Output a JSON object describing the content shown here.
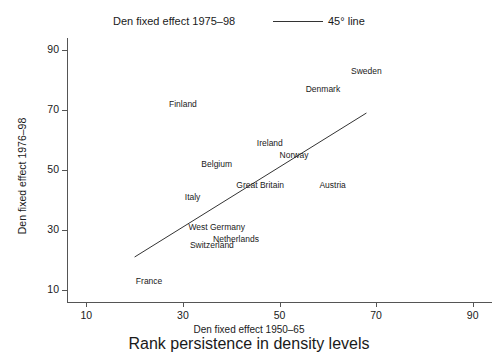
{
  "chart_data": {
    "type": "scatter",
    "title": "Rank persistence in density levels",
    "xlabel": "Den fixed effect 1950–65",
    "ylabel": "Den fixed effect 1976–98",
    "xlim": [
      6,
      94
    ],
    "ylim": [
      6,
      94
    ],
    "xticks": [
      10,
      30,
      50,
      70,
      90
    ],
    "yticks": [
      10,
      30,
      50,
      70,
      90
    ],
    "xtick_labels": [
      "10",
      "30",
      "50",
      "70",
      "90"
    ],
    "ytick_labels": [
      "10",
      "30",
      "50",
      "70",
      "90"
    ],
    "grid": false,
    "legend_position": "top",
    "legend": [
      {
        "name": "Den fixed effect 1975–98",
        "marker": "label-only"
      },
      {
        "name": "45° line",
        "marker": "line"
      }
    ],
    "series": [
      {
        "name": "Den fixed effect 1975–98",
        "marker": "text-label",
        "points": [
          {
            "label": "Sweden",
            "x": 68,
            "y": 83
          },
          {
            "label": "Denmark",
            "x": 59,
            "y": 77
          },
          {
            "label": "Finland",
            "x": 30,
            "y": 72
          },
          {
            "label": "Ireland",
            "x": 48,
            "y": 59
          },
          {
            "label": "Norway",
            "x": 53,
            "y": 55
          },
          {
            "label": "Belgium",
            "x": 37,
            "y": 52
          },
          {
            "label": "Great Britain",
            "x": 46,
            "y": 45
          },
          {
            "label": "Austria",
            "x": 61,
            "y": 45
          },
          {
            "label": "Italy",
            "x": 32,
            "y": 41
          },
          {
            "label": "West Germany",
            "x": 37,
            "y": 31
          },
          {
            "label": "Netherlands",
            "x": 41,
            "y": 27
          },
          {
            "label": "Switzerland",
            "x": 36,
            "y": 25
          },
          {
            "label": "France",
            "x": 23,
            "y": 13
          }
        ]
      }
    ],
    "reference_line": {
      "name": "45° line",
      "x_start": 20,
      "y_start": 21,
      "x_end": 68,
      "y_end": 69,
      "color": "#333333"
    }
  },
  "colors": {
    "background": "#ffffff",
    "axis": "#555555",
    "text": "#1a1a1a",
    "reference_line": "#333333"
  }
}
